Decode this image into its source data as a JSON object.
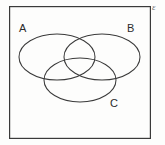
{
  "diagram": {
    "type": "venn",
    "background_color": "#fdfdfc",
    "stroke_color": "#3a3a3a",
    "label_color": "#2b2b2b",
    "universe": {
      "shape": "rectangle",
      "name": "universal-set-box",
      "x": 9,
      "y": 6,
      "width": 142,
      "height": 133,
      "stroke_width": 1.2
    },
    "sets": [
      {
        "id": "A",
        "label": "A",
        "shape": "ellipse",
        "cx": 57,
        "cy": 57,
        "rx": 38,
        "ry": 23,
        "label_x": 19,
        "label_y": 23
      },
      {
        "id": "B",
        "label": "B",
        "shape": "ellipse",
        "cx": 102,
        "cy": 57,
        "rx": 38,
        "ry": 23,
        "label_x": 127,
        "label_y": 23
      },
      {
        "id": "C",
        "label": "C",
        "shape": "ellipse",
        "cx": 80,
        "cy": 80,
        "rx": 36,
        "ry": 22,
        "label_x": 110,
        "label_y": 98
      }
    ],
    "annotation": {
      "text": "ε",
      "position": "outside-top-right",
      "x": 152,
      "y": 3
    }
  }
}
